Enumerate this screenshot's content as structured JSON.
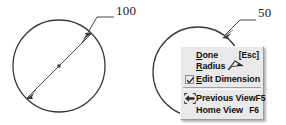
{
  "drawing": {
    "left_dimension": {
      "label": "100",
      "type": "diameter",
      "icon": "diameter-dimension-leader"
    },
    "right_dimension": {
      "label": "50",
      "type": "radius",
      "icon": "radius-dimension-leader"
    }
  },
  "context_menu": {
    "items": [
      {
        "id": "done",
        "label_prefix": "D",
        "label_rest": "one",
        "accel": "[Esc]",
        "icon": null,
        "checked": false
      },
      {
        "id": "radius",
        "label_prefix": "R",
        "label_rest": "adius",
        "accel": "",
        "icon": "radius-icon",
        "checked": false
      },
      {
        "id": "edit-dimension",
        "label_prefix": "E",
        "label_rest": "dit Dimension",
        "accel": "",
        "icon": null,
        "checked": true
      },
      {
        "id": "previous-view",
        "label_prefix": "",
        "label_rest": "Previous View",
        "accel": "F5",
        "icon": "previous-view-icon",
        "checked": false
      },
      {
        "id": "home-view",
        "label_prefix": "",
        "label_rest": "Home View",
        "accel": "F6",
        "icon": null,
        "checked": false
      }
    ],
    "separator_after_index": 2
  },
  "colors": {
    "line": "#3a3a3a",
    "menu_bg": "#e9e9e9",
    "menu_border": "#9a9a9a",
    "text": "#121212",
    "label": "#1a1a1a"
  }
}
